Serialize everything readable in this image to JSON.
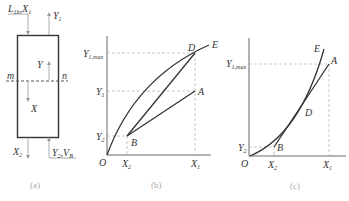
{
  "panel_a": {
    "caption": "(a)",
    "top_left_label": "L",
    "top_left_sub": "1b",
    "top_left_label2": "X",
    "top_left_sub2": "1",
    "top_right_label": "Y",
    "top_right_sub": "1",
    "section_left": "m",
    "section_right": "n",
    "internal_y": "Y",
    "internal_x": "X",
    "bottom_left_label": "X",
    "bottom_left_sub": "2",
    "bottom_right_label": "Y",
    "bottom_right_sub": "2",
    "bottom_right_label2": "V",
    "bottom_right_sub2": "B"
  },
  "panel_b": {
    "caption": "(b)",
    "origin": "O",
    "y_ticks": [
      {
        "label": "Y",
        "sub": "1,max"
      },
      {
        "label": "Y",
        "sub": "1"
      },
      {
        "label": "Y",
        "sub": "2"
      }
    ],
    "x_ticks": [
      {
        "label": "X",
        "sub": "2"
      },
      {
        "label": "X",
        "sub": "1"
      }
    ],
    "points": {
      "A": "A",
      "B": "B",
      "D": "D",
      "E": "E"
    }
  },
  "panel_c": {
    "caption": "(c)",
    "origin": "O",
    "y_ticks": [
      {
        "label": "Y",
        "sub": "1,max"
      },
      {
        "label": "Y",
        "sub": "2"
      }
    ],
    "x_ticks": [
      {
        "label": "X",
        "sub": "2"
      },
      {
        "label": "X",
        "sub": "1"
      }
    ],
    "points": {
      "A": "A",
      "B": "B",
      "D": "D",
      "E": "E"
    }
  }
}
